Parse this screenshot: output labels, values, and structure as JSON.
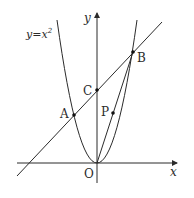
{
  "diagram": {
    "type": "coordinate-geometry",
    "curve_label": {
      "base": "y=x",
      "superscript": "2"
    },
    "axes": {
      "x_label": "x",
      "y_label": "y",
      "origin_label": "O"
    },
    "points": [
      {
        "name": "A",
        "label": "A",
        "px": [
          74,
          115
        ]
      },
      {
        "name": "B",
        "label": "B",
        "px": [
          133,
          52
        ]
      },
      {
        "name": "C",
        "label": "C",
        "px": [
          97,
          90
        ]
      },
      {
        "name": "P",
        "label": "P",
        "px": [
          113,
          113
        ]
      },
      {
        "name": "O",
        "label": "O",
        "px": [
          97,
          163
        ]
      }
    ],
    "colors": {
      "stroke": "#2b2b2b",
      "background": "#ffffff"
    }
  }
}
